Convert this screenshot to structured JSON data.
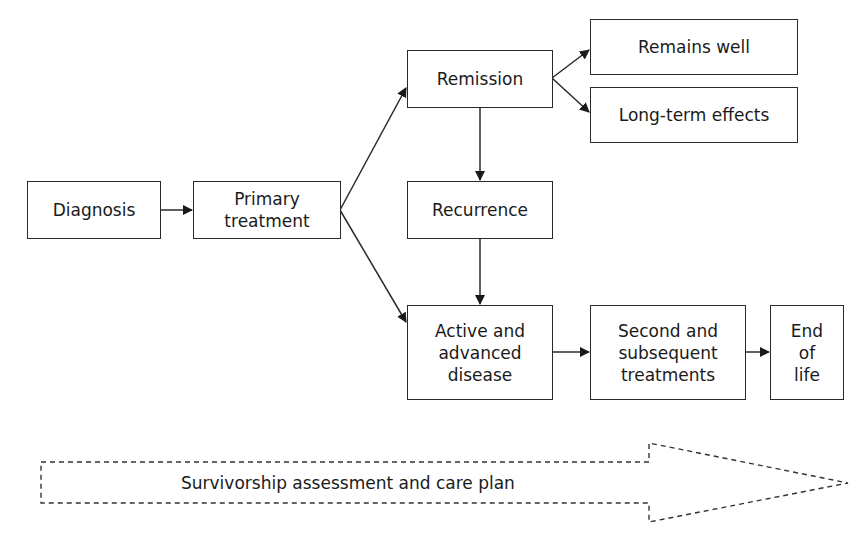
{
  "diagram": {
    "nodes": {
      "diagnosis": "Diagnosis",
      "primary_treatment": "Primary treatment",
      "remission": "Remission",
      "remains_well": "Remains well",
      "long_term_effects": "Long-term effects",
      "recurrence": "Recurrence",
      "active_advanced": "Active and advanced disease",
      "second_treatments": "Second and subsequent treatments",
      "end_of_life": "End of life"
    },
    "node_lines": {
      "primary_treatment": [
        "Primary",
        "treatment"
      ],
      "active_advanced": [
        "Active and",
        "advanced",
        "disease"
      ],
      "second_treatments": [
        "Second and",
        "subsequent",
        "treatments"
      ],
      "end_of_life": [
        "End",
        "of",
        "life"
      ]
    },
    "edges": [
      {
        "from": "diagnosis",
        "to": "primary_treatment"
      },
      {
        "from": "primary_treatment",
        "to": "remission"
      },
      {
        "from": "primary_treatment",
        "to": "active_advanced"
      },
      {
        "from": "remission",
        "to": "remains_well"
      },
      {
        "from": "remission",
        "to": "long_term_effects"
      },
      {
        "from": "remission",
        "to": "recurrence"
      },
      {
        "from": "recurrence",
        "to": "active_advanced"
      },
      {
        "from": "active_advanced",
        "to": "second_treatments"
      },
      {
        "from": "second_treatments",
        "to": "end_of_life"
      }
    ],
    "banner": "Survivorship assessment and care plan",
    "colors": {
      "line": "#2a2a2a",
      "text": "#1a1a1a",
      "background": "#ffffff"
    }
  }
}
